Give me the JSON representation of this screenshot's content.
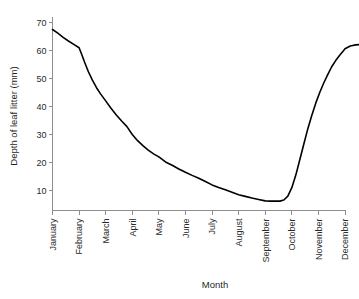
{
  "chart_data": {
    "type": "line",
    "title": "",
    "xlabel": "Month",
    "ylabel": "Depth of leaf litter (mm)",
    "categories": [
      "January",
      "February",
      "March",
      "April",
      "May",
      "June",
      "July",
      "August",
      "September",
      "October",
      "November",
      "December"
    ],
    "values": [
      67.5,
      61,
      42,
      30,
      22,
      16.5,
      12,
      8.5,
      6.3,
      22,
      50,
      62
    ],
    "series": [
      {
        "name": "Depth of leaf litter",
        "values": [
          67.5,
          61,
          42,
          30,
          22,
          16.5,
          12,
          8.5,
          6.3,
          22,
          50,
          62
        ],
        "color": "#000000"
      }
    ],
    "ylim": [
      0,
      72
    ],
    "xlim": [
      0,
      11
    ],
    "yticks": [
      10,
      20,
      30,
      40,
      50,
      60,
      70
    ],
    "ytick_labels": [
      "10",
      "20",
      "30",
      "40",
      "50",
      "60",
      "70"
    ],
    "xtick_labels": [
      "January",
      "February",
      "March",
      "April",
      "May",
      "June",
      "July",
      "August",
      "September",
      "October",
      "November",
      "December"
    ],
    "grid": false,
    "legend": false,
    "legend_position": "none",
    "xtick_label_rotation": -90,
    "ylabel_rotation": -90,
    "line_color": "#000000",
    "axis_color": "#8d8d8d",
    "background_color": "#ffffff",
    "annotations": [],
    "dense_curve": [
      [
        0.0,
        67.5
      ],
      [
        0.2,
        66.2
      ],
      [
        0.4,
        64.7
      ],
      [
        0.6,
        63.4
      ],
      [
        0.8,
        62.2
      ],
      [
        1.0,
        61.0
      ],
      [
        1.1,
        58.6
      ],
      [
        1.2,
        56.0
      ],
      [
        1.35,
        52.4
      ],
      [
        1.5,
        49.4
      ],
      [
        1.65,
        46.8
      ],
      [
        1.8,
        44.6
      ],
      [
        2.0,
        42.0
      ],
      [
        2.2,
        39.4
      ],
      [
        2.4,
        37.0
      ],
      [
        2.6,
        34.8
      ],
      [
        2.8,
        32.8
      ],
      [
        3.0,
        30.0
      ],
      [
        3.2,
        27.8
      ],
      [
        3.4,
        26.0
      ],
      [
        3.6,
        24.4
      ],
      [
        3.8,
        23.1
      ],
      [
        4.0,
        22.0
      ],
      [
        4.25,
        20.2
      ],
      [
        4.5,
        19.0
      ],
      [
        4.75,
        17.7
      ],
      [
        5.0,
        16.5
      ],
      [
        5.25,
        15.4
      ],
      [
        5.5,
        14.4
      ],
      [
        5.75,
        13.2
      ],
      [
        6.0,
        12.0
      ],
      [
        6.25,
        11.1
      ],
      [
        6.5,
        10.3
      ],
      [
        6.75,
        9.4
      ],
      [
        7.0,
        8.5
      ],
      [
        7.25,
        7.9
      ],
      [
        7.5,
        7.3
      ],
      [
        7.75,
        6.8
      ],
      [
        8.0,
        6.3
      ],
      [
        8.2,
        6.2
      ],
      [
        8.4,
        6.2
      ],
      [
        8.55,
        6.2
      ],
      [
        8.7,
        6.6
      ],
      [
        8.85,
        8.0
      ],
      [
        9.0,
        11.0
      ],
      [
        9.15,
        15.5
      ],
      [
        9.3,
        21.0
      ],
      [
        9.45,
        26.5
      ],
      [
        9.6,
        32.0
      ],
      [
        9.75,
        36.8
      ],
      [
        9.9,
        41.2
      ],
      [
        10.05,
        45.0
      ],
      [
        10.2,
        48.4
      ],
      [
        10.35,
        51.4
      ],
      [
        10.5,
        54.2
      ],
      [
        10.65,
        56.4
      ],
      [
        10.8,
        58.3
      ],
      [
        10.95,
        60.0
      ],
      [
        11.0,
        60.6
      ],
      [
        11.2,
        61.6
      ],
      [
        11.4,
        62.0
      ],
      [
        11.55,
        62.1
      ]
    ]
  },
  "figure": {
    "name": "leaf-litter-depth-chart"
  }
}
